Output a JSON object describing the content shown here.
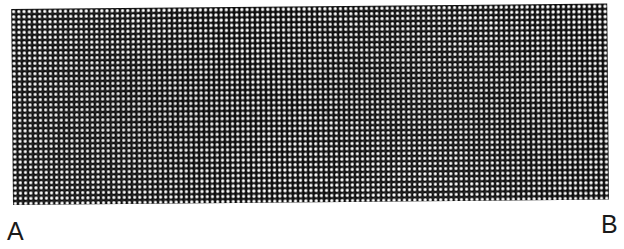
{
  "figure": {
    "labels": {
      "left": "A",
      "right": "B"
    },
    "texture": {
      "name": "dotted-halftone-band",
      "background_color": "#0d0d0d",
      "dot_color": "#ffffff",
      "dot_pitch_px": 5.2,
      "dot_diameter_px": 2.3,
      "rotation_deg": -0.52
    },
    "page_background": "#ffffff"
  }
}
